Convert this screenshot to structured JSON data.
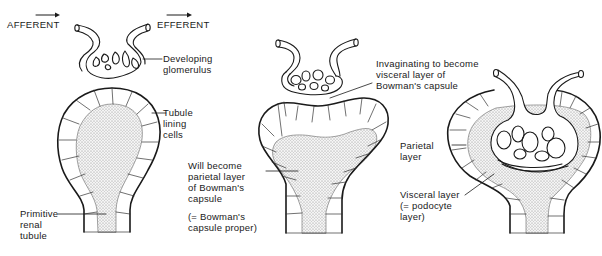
{
  "diagram": {
    "type": "biological-stages",
    "stages": [
      {
        "id": "stage-1",
        "labels": {
          "afferent": "AFFERENT",
          "efferent": "EFFERENT",
          "developing_glomerulus": "Developing\nglomerulus",
          "tubule_lining_cells": "Tubule\nlining\ncells",
          "primitive_renal_tubule": "Primitive\nrenal\ntubule"
        }
      },
      {
        "id": "stage-2",
        "labels": {
          "invaginating": "Invaginating to become\nvisceral layer of\nBowman's capsule",
          "will_become_parietal": "Will become\nparietal layer\nof Bowman's\ncapsule",
          "bowmans_capsule_proper": "(= Bowman's\ncapsule proper)"
        }
      },
      {
        "id": "stage-3",
        "labels": {
          "parietal_layer": "Parietal\nlayer",
          "visceral_layer": "Visceral layer\n(= podocyte\nlayer)"
        }
      }
    ],
    "colors": {
      "line": "#1a1a1a",
      "stipple": "#9a9a9a",
      "background": "#ffffff"
    }
  }
}
